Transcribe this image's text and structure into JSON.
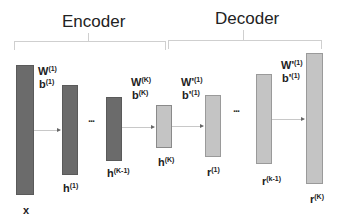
{
  "sections": {
    "encoder": "Encoder",
    "decoder": "Decoder"
  },
  "params": {
    "w1": "W",
    "w1_sup": "(1)",
    "b1": "b",
    "b1_sup": "(1)",
    "wK": "W",
    "wK_sup": "(K)",
    "bK": "b",
    "bK_sup": "(K)",
    "wp1": "W'",
    "wp1_sup": "(1)",
    "bp1": "b'",
    "bp1_sup": "(1)",
    "wp1b": "W'",
    "wp1b_sup": "(1)",
    "bp1b": "b'",
    "bp1b_sup": "(1)"
  },
  "nodes": {
    "x": "x",
    "h1": "h",
    "h1_sup": "(1)",
    "hK1": "h",
    "hK1_sup": "(K-1)",
    "hK": "h",
    "hK_sup": "(K)",
    "r1": "r",
    "r1_sup": "(1)",
    "rk1": "r",
    "rk1_sup": "(k-1)",
    "rK": "r",
    "rK_sup": "(K)"
  },
  "ellipsis": "...",
  "colors": {
    "encoder_layer": "#6b6b6b",
    "code_and_decoder_layer": "#c4c4c4"
  }
}
